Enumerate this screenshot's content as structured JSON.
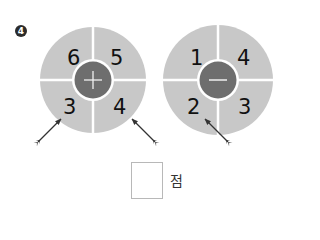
{
  "problem": {
    "number": "4",
    "wheels": [
      {
        "operator": "+",
        "operator_name": "plus",
        "quadrants": {
          "top_left": "6",
          "top_right": "5",
          "bottom_left": "3",
          "bottom_right": "4"
        },
        "arrow_targets": [
          "3",
          "4"
        ]
      },
      {
        "operator": "−",
        "operator_name": "minus",
        "quadrants": {
          "top_left": "1",
          "top_right": "4",
          "bottom_left": "2",
          "bottom_right": "3"
        },
        "arrow_targets": [
          "2"
        ]
      }
    ],
    "answer": {
      "value": "",
      "unit": "점"
    }
  },
  "colors": {
    "wheel": "#c8c8c8",
    "center": "#6e6e6e",
    "divider": "#ffffff",
    "arrow": "#333333"
  }
}
